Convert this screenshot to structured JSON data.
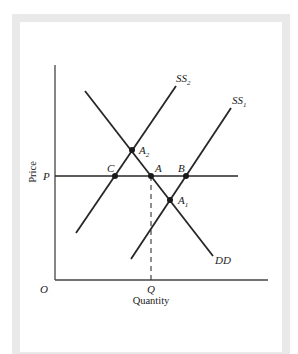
{
  "diagram": {
    "type": "supply-demand",
    "axes": {
      "y_label": "Price",
      "x_label": "Quantity",
      "origin_label": "O"
    },
    "level_labels": {
      "price": "P",
      "quantity": "Q"
    },
    "curves": [
      {
        "id": "DD",
        "label": "DD",
        "kind": "demand"
      },
      {
        "id": "SS1",
        "label": "SS",
        "sub": "1",
        "kind": "supply"
      },
      {
        "id": "SS2",
        "label": "SS",
        "sub": "2",
        "kind": "supply"
      }
    ],
    "points": [
      {
        "id": "A",
        "label": "A"
      },
      {
        "id": "B",
        "label": "B"
      },
      {
        "id": "C",
        "label": "C"
      },
      {
        "id": "A1",
        "label": "A",
        "sub": "1"
      },
      {
        "id": "A2",
        "label": "A",
        "sub": "2"
      }
    ],
    "colors": {
      "line": "#262626",
      "frame": "#e9e9e9",
      "background": "#ffffff"
    }
  }
}
